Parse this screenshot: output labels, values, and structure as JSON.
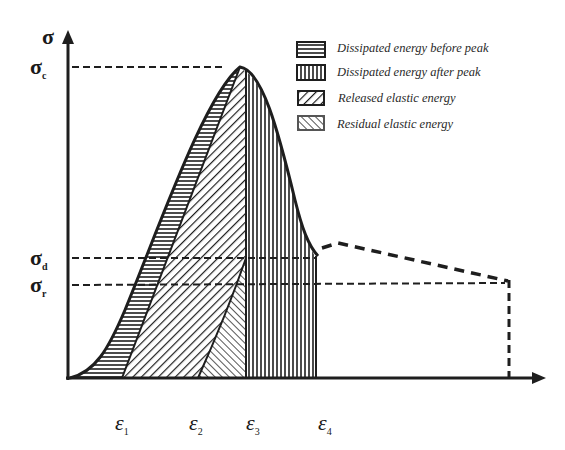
{
  "diagram": {
    "type": "stress-strain energy partition diagram",
    "y_axis": {
      "label": "σ"
    },
    "y_markers": [
      {
        "id": "sigma_c",
        "symbol": "σ",
        "subscript": "c"
      },
      {
        "id": "sigma_d",
        "symbol": "σ",
        "subscript": "d"
      },
      {
        "id": "sigma_r",
        "symbol": "σ",
        "subscript": "r"
      }
    ],
    "x_markers": [
      {
        "id": "eps1",
        "symbol": "ε",
        "subscript": "1"
      },
      {
        "id": "eps2",
        "symbol": "ε",
        "subscript": "2"
      },
      {
        "id": "eps3",
        "symbol": "ε",
        "subscript": "3"
      },
      {
        "id": "eps4",
        "symbol": "ε",
        "subscript": "4"
      }
    ],
    "legend": [
      {
        "pattern": "horizontal-lines",
        "label": "Dissipated energy before peak"
      },
      {
        "pattern": "vertical-lines",
        "label": "Dissipated energy after peak"
      },
      {
        "pattern": "diagonal-forward",
        "label": "Released elastic energy"
      },
      {
        "pattern": "diagonal-backward",
        "label": "Residual elastic energy"
      }
    ],
    "colors": {
      "ink": "#1e1e1e",
      "background": "#ffffff"
    }
  }
}
